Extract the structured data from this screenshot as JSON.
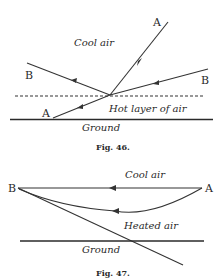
{
  "fig46": {
    "caption": "Fig. 46.",
    "labels": {
      "a_top": "A",
      "a_bottom": "A",
      "b_left": "B",
      "b_right": "B",
      "cool_air": "Cool air",
      "hot_layer": "Hot layer of air",
      "ground": "Ground"
    },
    "colors": {
      "stroke": "#333333",
      "background": "#ffffff"
    }
  },
  "fig47": {
    "caption": "Fig. 47.",
    "labels": {
      "b": "B",
      "a": "A",
      "cool_air": "Cool air",
      "heated_air": "Heated air",
      "ground": "Ground"
    }
  }
}
